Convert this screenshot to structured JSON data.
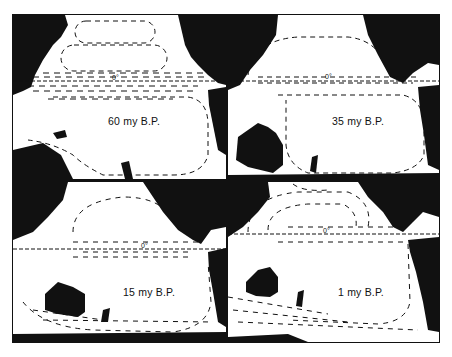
{
  "figure": {
    "panels": [
      {
        "id": "p1",
        "label": "60 my B.P.",
        "equator_label": "0°"
      },
      {
        "id": "p2",
        "label": "35 my B.P.",
        "equator_label": "0°"
      },
      {
        "id": "p3",
        "label": "15 my B.P.",
        "equator_label": "0°"
      },
      {
        "id": "p4",
        "label": "1 my B.P.",
        "equator_label": "0°"
      }
    ]
  },
  "colors": {
    "land": "#111111",
    "ocean": "#ffffff",
    "arrows": "#111111"
  }
}
